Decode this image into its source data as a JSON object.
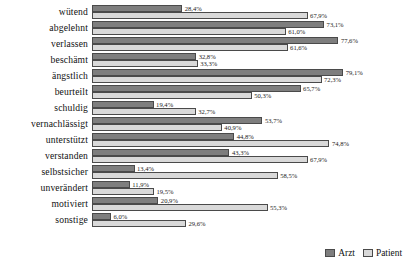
{
  "chart_data": {
    "type": "bar",
    "orientation": "horizontal",
    "title": "",
    "subtitle": "",
    "xlabel": "",
    "ylabel": "",
    "xlim": [
      0,
      100
    ],
    "grid": false,
    "value_suffix": "%",
    "decimal_separator": ",",
    "legend_position": "bottom-right",
    "categories": [
      "wütend",
      "abgelehnt",
      "verlassen",
      "beschämt",
      "ängstlich",
      "beurteilt",
      "schuldig",
      "vernachlässigt",
      "unterstützt",
      "verstanden",
      "selbstsicher",
      "unverändert",
      "motiviert",
      "sonstige"
    ],
    "series": [
      {
        "name": "Arzt",
        "color": "#7e7e7e",
        "values": [
          28.4,
          73.1,
          77.6,
          32.8,
          79.1,
          65.7,
          19.4,
          53.7,
          44.8,
          43.3,
          13.4,
          11.9,
          20.9,
          6.0
        ],
        "labels": [
          "28,4%",
          "73,1%",
          "77,6%",
          "32,8%",
          "79,1%",
          "65,7%",
          "19,4%",
          "53,7%",
          "44,8%",
          "43,3%",
          "13,4%",
          "11,9%",
          "20,9%",
          "6,0%"
        ]
      },
      {
        "name": "Patient",
        "color": "#d9d9d9",
        "values": [
          67.9,
          61.0,
          61.6,
          33.3,
          72.3,
          50.3,
          32.7,
          40.9,
          74.8,
          67.9,
          58.5,
          19.5,
          55.3,
          29.6
        ],
        "labels": [
          "67,9%",
          "61,0%",
          "61,6%",
          "33,3%",
          "72,3%",
          "50,3%",
          "32,7%",
          "40,9%",
          "74,8%",
          "67,9%",
          "58,5%",
          "19,5%",
          "55,3%",
          "29,6%"
        ]
      }
    ]
  },
  "legend": {
    "items": [
      {
        "label": "Arzt",
        "color": "#7e7e7e"
      },
      {
        "label": "Patient",
        "color": "#d9d9d9"
      }
    ]
  }
}
